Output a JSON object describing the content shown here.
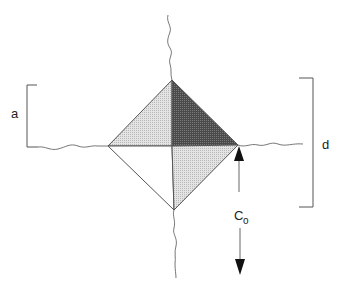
{
  "diagram": {
    "labels": {
      "a": "a",
      "d": "d",
      "c_main": "C",
      "c_sub": "o"
    },
    "colors": {
      "stroke": "#555555",
      "light_fill": "#d9d9d9",
      "dark_fill": "#5a5a5a",
      "white_fill": "#ffffff",
      "arrow": "#111111"
    }
  }
}
